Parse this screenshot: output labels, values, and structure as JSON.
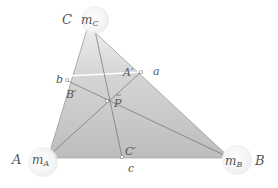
{
  "diagram": {
    "type": "triangle-barycentric",
    "fill_color": "#c4c4c4",
    "fill_color_light": "#e4e4e4",
    "line_color": "#6e6e6e",
    "label_color": "#555555",
    "vertices": {
      "A": {
        "label": "A",
        "mass_label": "m",
        "mass_sub": "A"
      },
      "B": {
        "label": "B",
        "mass_label": "m",
        "mass_sub": "B"
      },
      "C": {
        "label": "C",
        "mass_label": "m",
        "mass_sub": "C"
      }
    },
    "points": {
      "P": {
        "label": "P"
      },
      "A_prime": {
        "label": "A′"
      },
      "B_prime": {
        "label": "B′"
      },
      "C_prime": {
        "label": "C′"
      },
      "a": {
        "label": "a"
      },
      "b": {
        "label": "b"
      },
      "c": {
        "label": "c"
      }
    }
  }
}
